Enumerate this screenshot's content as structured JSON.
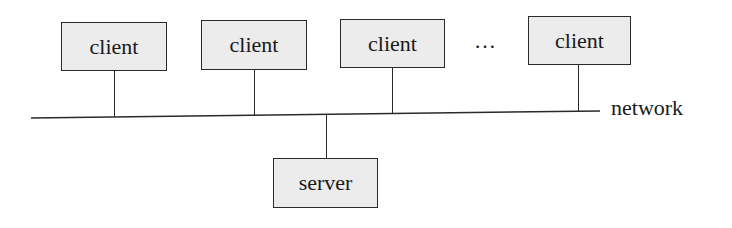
{
  "diagram": {
    "title": "",
    "clients": [
      {
        "label": "client",
        "x": 61,
        "y": 22,
        "w": 106,
        "h": 49,
        "link_x": 114
      },
      {
        "label": "client",
        "x": 201,
        "y": 20,
        "w": 106,
        "h": 50,
        "link_x": 254
      },
      {
        "label": "client",
        "x": 340,
        "y": 19,
        "w": 105,
        "h": 49,
        "link_x": 392
      },
      {
        "label": "client",
        "x": 528,
        "y": 16,
        "w": 103,
        "h": 49,
        "link_x": 578
      }
    ],
    "ellipsis": "…",
    "network": {
      "label": "network",
      "x1": 31,
      "y1": 118,
      "x2": 600,
      "y2": 111
    },
    "server": {
      "label": "server",
      "x": 273,
      "y": 158,
      "w": 105,
      "h": 50,
      "link_x": 326
    },
    "colors": {
      "box_fill": "#ececec",
      "stroke": "#2a2a2a",
      "text": "#1a1a1a"
    }
  }
}
